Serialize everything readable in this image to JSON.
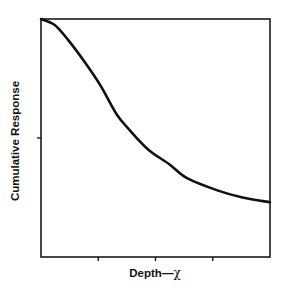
{
  "chart_data": {
    "type": "line",
    "title": "",
    "xlabel": "Depth—χ",
    "ylabel": "Cumulative Response",
    "xlabel_parts": {
      "text": "Depth—",
      "symbol": "χ"
    },
    "grid": false,
    "legend": null,
    "x_ticks": [
      0.25,
      0.5,
      0.75
    ],
    "y_ticks": [
      0.5
    ],
    "xlim": [
      0,
      1
    ],
    "ylim": [
      0,
      1
    ],
    "series": [
      {
        "name": "Cumulative Response",
        "x": [
          0.0,
          0.06,
          0.12,
          0.19,
          0.26,
          0.33,
          0.39,
          0.47,
          0.56,
          0.64,
          0.77,
          0.88,
          1.0
        ],
        "y": [
          1.0,
          0.975,
          0.91,
          0.82,
          0.72,
          0.6,
          0.53,
          0.45,
          0.39,
          0.33,
          0.28,
          0.25,
          0.23
        ]
      }
    ],
    "annotations": []
  },
  "colors": {
    "line": "#111111",
    "axis": "#1a1a1a",
    "background": "#ffffff"
  }
}
